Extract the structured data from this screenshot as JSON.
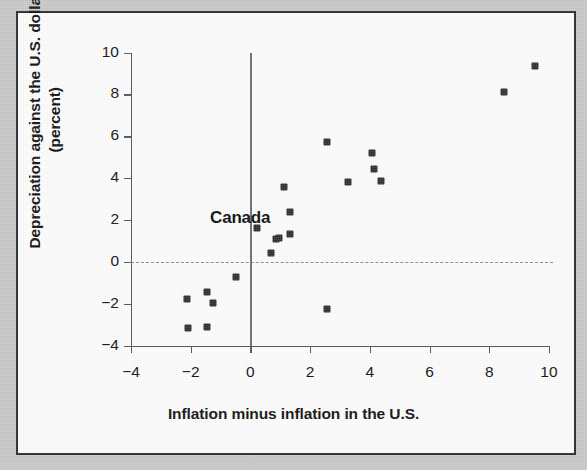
{
  "figure": {
    "background_color": "#c9c9c9",
    "panel_color": "#fdfdfd",
    "border_color": "#2b2b2b",
    "marker_color": "#2f2f2f",
    "axis_color": "#565656",
    "zeroline_color": "#8d8d8d"
  },
  "annotations": {
    "canada_label": "Canada"
  },
  "chart_data": {
    "type": "scatter",
    "title": "",
    "xlabel": "Inflation minus inflation in the U.S.",
    "ylabel": "Depreciation against the U.S. dollar",
    "ylabel_line1": "Depreciation against the U.S. dollar",
    "ylabel_line2": "(percent)",
    "xlim": [
      -4,
      10
    ],
    "ylim": [
      -4,
      10
    ],
    "xticks": [
      -4,
      -2,
      0,
      2,
      4,
      6,
      8,
      10
    ],
    "xticklabels": [
      "−4",
      "−2",
      "0",
      "2",
      "4",
      "6",
      "8",
      "10"
    ],
    "yticks": [
      -4,
      -2,
      0,
      2,
      4,
      6,
      8,
      10
    ],
    "yticklabels": [
      "−4",
      "−2",
      "0",
      "2",
      "4",
      "6",
      "8",
      "10"
    ],
    "grid": false,
    "legend": null,
    "reference_lines": [
      {
        "axis": "y",
        "value": 0,
        "style": "dashed",
        "color": "#8d8d8d"
      },
      {
        "axis": "x",
        "value": 0,
        "style": "solid",
        "color": "#6e6e6e"
      }
    ],
    "annotations": [
      {
        "text": "Canada",
        "x": -1.35,
        "y": 2.05
      }
    ],
    "points": [
      {
        "x": -2.11,
        "y": -1.77
      },
      {
        "x": -2.08,
        "y": -3.15
      },
      {
        "x": -1.44,
        "y": -1.43
      },
      {
        "x": -1.44,
        "y": -3.1
      },
      {
        "x": -1.24,
        "y": -1.96
      },
      {
        "x": -0.47,
        "y": -0.72
      },
      {
        "x": 0.23,
        "y": 1.62
      },
      {
        "x": 0.7,
        "y": 0.43
      },
      {
        "x": 0.87,
        "y": 1.1
      },
      {
        "x": 0.97,
        "y": 1.15
      },
      {
        "x": 1.14,
        "y": 3.58
      },
      {
        "x": 1.31,
        "y": 2.39
      },
      {
        "x": 1.34,
        "y": 1.34
      },
      {
        "x": 2.55,
        "y": 5.73
      },
      {
        "x": 2.55,
        "y": -2.24
      },
      {
        "x": 3.28,
        "y": 3.82
      },
      {
        "x": 4.09,
        "y": 5.2
      },
      {
        "x": 4.15,
        "y": 4.44
      },
      {
        "x": 4.36,
        "y": 3.87
      },
      {
        "x": 8.51,
        "y": 8.11
      },
      {
        "x": 9.55,
        "y": 9.36
      }
    ]
  }
}
